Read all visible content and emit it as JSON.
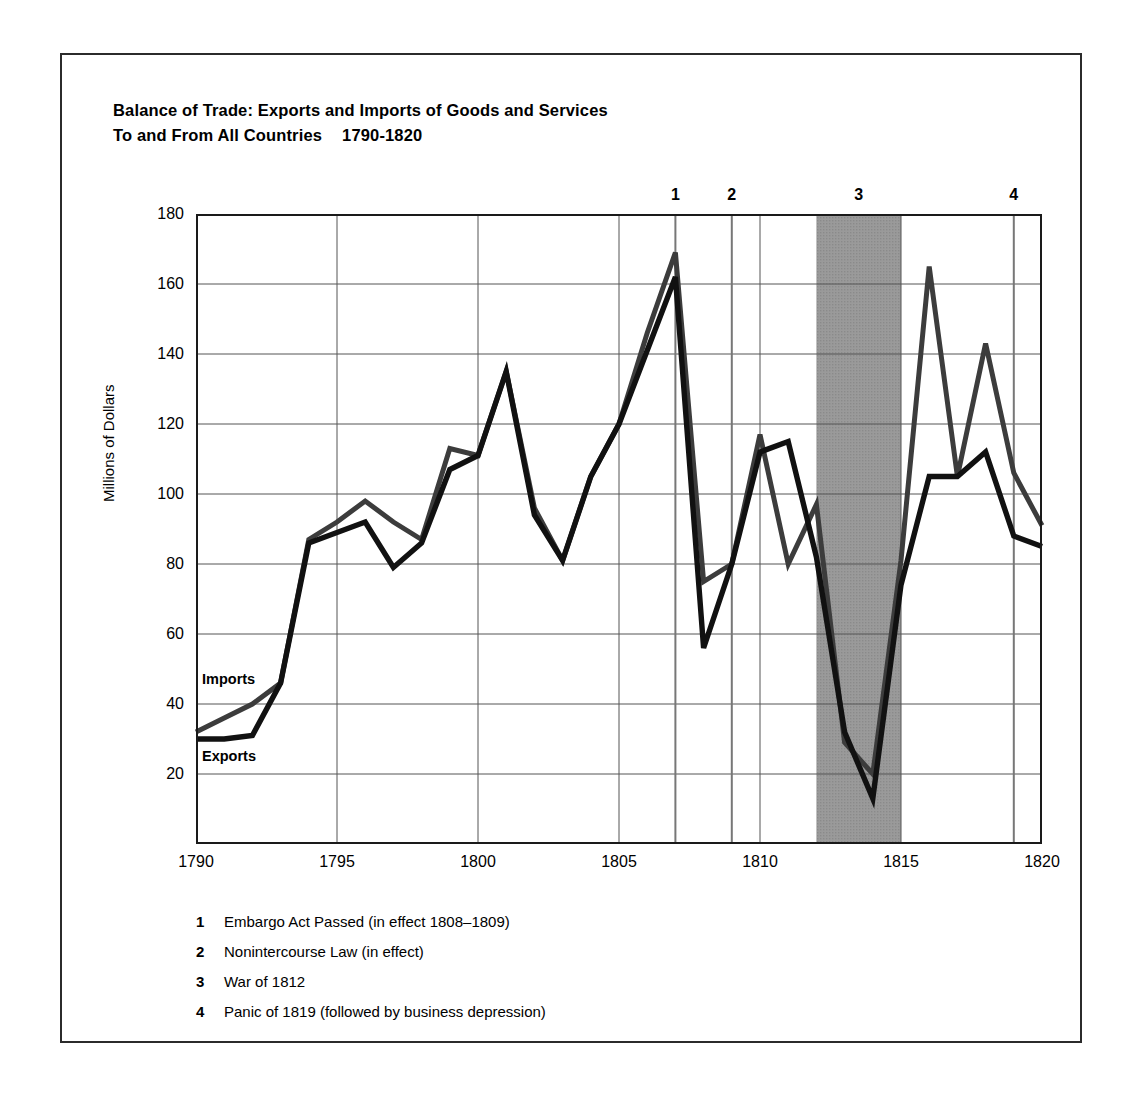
{
  "figure": {
    "title_line1": "Balance of Trade: Exports and Imports of Goods and Services",
    "title_line2": "To and From All Countries",
    "title_years": "1790-1820"
  },
  "series_labels": {
    "imports": "Imports",
    "exports": "Exports"
  },
  "events": [
    {
      "num": "1",
      "year": 1807,
      "label": "Embargo Act Passed (in effect 1808–1809)"
    },
    {
      "num": "2",
      "year": 1809,
      "label": "Nonintercourse Law (in effect)"
    },
    {
      "num": "3",
      "year": 1813.5,
      "label": "War of 1812"
    },
    {
      "num": "4",
      "year": 1819,
      "label": "Panic of 1819 (followed by business depression)"
    }
  ],
  "shaded_band": {
    "start": 1812,
    "end": 1815,
    "color": "#9a9a9a"
  },
  "colors": {
    "exports_line": "#111111",
    "imports_line": "#3c3c3c",
    "frame": "#2b2b2b",
    "grid": "#555555",
    "axis": "#1a1a1a"
  },
  "chart_data": {
    "type": "line",
    "xlabel": "",
    "ylabel": "Millions of Dollars",
    "xlim": [
      1790,
      1820
    ],
    "ylim": [
      0,
      180
    ],
    "xticks": [
      1790,
      1795,
      1800,
      1805,
      1810,
      1815,
      1820
    ],
    "yticks": [
      20,
      40,
      60,
      80,
      100,
      120,
      140,
      160,
      180
    ],
    "grid": true,
    "legend": "inline-labels",
    "x": [
      1790,
      1791,
      1792,
      1793,
      1794,
      1795,
      1796,
      1797,
      1798,
      1799,
      1800,
      1801,
      1802,
      1803,
      1804,
      1805,
      1806,
      1807,
      1808,
      1809,
      1810,
      1811,
      1812,
      1813,
      1814,
      1815,
      1816,
      1817,
      1818,
      1819,
      1820
    ],
    "series": [
      {
        "name": "Imports",
        "values": [
          32,
          36,
          40,
          46,
          87,
          92,
          98,
          92,
          87,
          113,
          111,
          135,
          96,
          81,
          105,
          120,
          146,
          169,
          75,
          80,
          117,
          80,
          97,
          29,
          20,
          81,
          165,
          105,
          143,
          106,
          91
        ]
      },
      {
        "name": "Exports",
        "values": [
          30,
          30,
          31,
          46,
          86,
          89,
          92,
          79,
          86,
          107,
          111,
          135,
          94,
          81,
          105,
          120,
          141,
          162,
          56,
          80,
          112,
          115,
          82,
          32,
          13,
          74,
          105,
          105,
          112,
          88,
          85
        ]
      }
    ]
  }
}
